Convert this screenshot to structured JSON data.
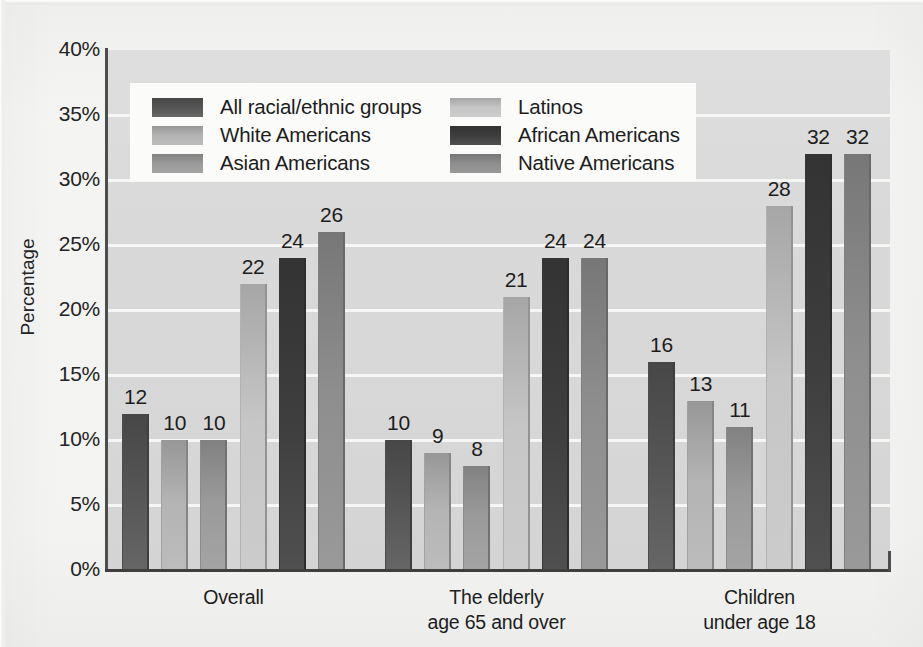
{
  "chart_data": {
    "type": "bar",
    "title": "",
    "xlabel": "",
    "ylabel": "Percentage",
    "ylim": [
      0,
      40
    ],
    "ytick_labels": [
      "0%",
      "5%",
      "10%",
      "15%",
      "20%",
      "25%",
      "30%",
      "35%",
      "40%"
    ],
    "ytick_values": [
      0,
      5,
      10,
      15,
      20,
      25,
      30,
      35,
      40
    ],
    "grid": true,
    "legend_position": "upper-left-inside",
    "categories": [
      "Overall",
      "The elderly age 65 and over",
      "Children under age 18"
    ],
    "category_lines": [
      [
        "Overall"
      ],
      [
        "The elderly",
        "age 65 and over"
      ],
      [
        "Children",
        "under age 18"
      ]
    ],
    "series": [
      {
        "name": "All racial/ethnic groups",
        "color": "#555555",
        "values": [
          12,
          10,
          16
        ]
      },
      {
        "name": "White Americans",
        "color": "#b4b4b4",
        "values": [
          10,
          9,
          13
        ]
      },
      {
        "name": "Asian Americans",
        "color": "#9a9a9a",
        "values": [
          10,
          8,
          11
        ]
      },
      {
        "name": "Latinos",
        "color": "#c6c6c6",
        "values": [
          22,
          21,
          28
        ]
      },
      {
        "name": "African Americans",
        "color": "#3d3d3d",
        "values": [
          24,
          24,
          32
        ]
      },
      {
        "name": "Native Americans",
        "color": "#8e8e8e",
        "values": [
          26,
          24,
          32
        ]
      }
    ],
    "value_labels": [
      [
        "12",
        "10",
        "10",
        "22",
        "24",
        "26"
      ],
      [
        "10",
        "9",
        "8",
        "21",
        "24",
        "24"
      ],
      [
        "16",
        "13",
        "11",
        "28",
        "32",
        "32"
      ]
    ]
  },
  "legend": {
    "columns": [
      [
        {
          "label": "All racial/ethnic groups",
          "color": "#555555"
        },
        {
          "label": "White Americans",
          "color": "#b4b4b4"
        },
        {
          "label": "Asian Americans",
          "color": "#9a9a9a"
        }
      ],
      [
        {
          "label": "Latinos",
          "color": "#c6c6c6"
        },
        {
          "label": "African Americans",
          "color": "#3d3d3d"
        },
        {
          "label": "Native Americans",
          "color": "#8e8e8e"
        }
      ]
    ]
  },
  "colors": {
    "plot_background": "#d9d9d9",
    "page_background": "#f2f2f0",
    "gridline": "#f6f6f4",
    "axis": "#3f3f3f",
    "text": "#1d1d1d",
    "legend_background": "#fbfbfa"
  }
}
